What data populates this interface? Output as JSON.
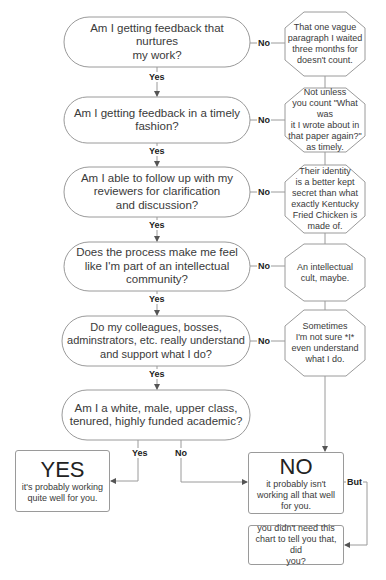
{
  "colors": {
    "stroke": "#9a9a9a",
    "text": "#333333",
    "background": "#ffffff"
  },
  "questions": [
    {
      "text": "Am I getting feedback that nurtures my work?",
      "lines": [
        "Am I getting feedback that nurtures",
        "my work?"
      ]
    },
    {
      "text": "Am I getting feedback in a timely fashion?",
      "lines": [
        "Am I getting feedback in a timely",
        "fashion?"
      ]
    },
    {
      "text": "Am I able to follow up with my reviewers for clarification and discussion?",
      "lines": [
        "Am I able to follow up with my",
        "reviewers for clarification",
        "and discussion?"
      ]
    },
    {
      "text": "Does the process make me feel like I'm part of an intellectual community?",
      "lines": [
        "Does the process make me feel",
        "like I'm part of an intellectual",
        "community?"
      ]
    },
    {
      "text": "Do my colleagues, bosses, adminstrators, etc. really understand and support what I do?",
      "lines": [
        "Do my colleagues, bosses,",
        "adminstrators, etc. really understand",
        "and support what I do?"
      ]
    },
    {
      "text": "Am I a white, male, upper class, tenured, highly funded academic?",
      "lines": [
        "Am I a white, male, upper class,",
        "tenured, highly funded academic?"
      ]
    }
  ],
  "responses": [
    {
      "lines": [
        "That one vague",
        "paragraph I waited",
        "three months for",
        "doesn't count."
      ]
    },
    {
      "lines": [
        "Not unless",
        "you count \"What was",
        "it I wrote about in",
        "that paper again?\"",
        "as timely."
      ]
    },
    {
      "lines": [
        "Their identity",
        "is a better kept",
        "secret than what",
        "exactly Kentucky",
        "Fried Chicken is",
        "made of."
      ]
    },
    {
      "lines": [
        "An intellectual",
        "cult, maybe."
      ]
    },
    {
      "lines": [
        "Sometimes",
        "I'm not sure *I*",
        "even understand",
        "what I do."
      ]
    }
  ],
  "labels": {
    "yes": "Yes",
    "no": "No",
    "but": "But"
  },
  "outcomes": {
    "yes": {
      "title": "YES",
      "lines": [
        "it's probably working",
        "quite well for you."
      ]
    },
    "no": {
      "title": "NO",
      "lines": [
        "it probably isn't",
        "working all that well",
        "for you."
      ]
    },
    "final": {
      "lines": [
        "you didn't need this",
        "chart to tell you that, did",
        "you?"
      ]
    }
  }
}
